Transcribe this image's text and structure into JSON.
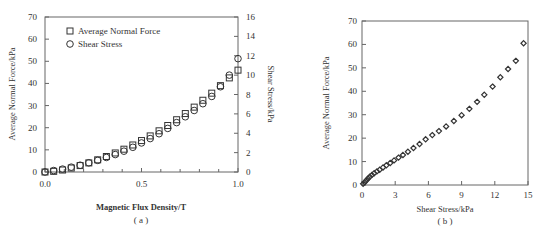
{
  "chart_data": [
    {
      "id": "a",
      "type": "scatter",
      "panel_label": "( a )",
      "title": "",
      "xlabel": "Magnetic Flux Density/T",
      "ylabel": "Average Normal Force/kPa",
      "y2label": "Shear Stress/kPa",
      "xlim": [
        0,
        1.0
      ],
      "ylim": [
        0,
        70
      ],
      "y2lim": [
        0,
        16
      ],
      "xticks": [
        "0.0",
        "0.5",
        "1.0"
      ],
      "yticks": [
        "0",
        "10",
        "20",
        "30",
        "40",
        "50",
        "60",
        "70"
      ],
      "y2ticks": [
        "0",
        "2",
        "4",
        "6",
        "8",
        "10",
        "12",
        "14",
        "16"
      ],
      "grid": false,
      "legend_position": "upper-left",
      "x": [
        0.0,
        0.045,
        0.091,
        0.136,
        0.182,
        0.227,
        0.273,
        0.318,
        0.364,
        0.409,
        0.455,
        0.5,
        0.545,
        0.591,
        0.636,
        0.682,
        0.727,
        0.773,
        0.818,
        0.864,
        0.909,
        0.955,
        1.0
      ],
      "series": [
        {
          "name": "Average Normal Force",
          "marker": "square",
          "axis": "left",
          "values": [
            0,
            0.3,
            0.9,
            1.8,
            2.9,
            4.1,
            5.5,
            7.0,
            8.6,
            10.3,
            12.2,
            14.2,
            16.3,
            18.6,
            21.0,
            23.6,
            26.4,
            29.3,
            32.4,
            35.6,
            39.0,
            42.5,
            46.0
          ]
        },
        {
          "name": "Shear Stress",
          "marker": "circle",
          "axis": "right",
          "values": [
            0,
            0.15,
            0.3,
            0.5,
            0.7,
            0.95,
            1.2,
            1.5,
            1.8,
            2.15,
            2.55,
            3.0,
            3.45,
            3.95,
            4.5,
            5.1,
            5.7,
            6.35,
            7.05,
            7.8,
            8.8,
            10.0,
            11.7
          ]
        }
      ]
    },
    {
      "id": "b",
      "type": "scatter",
      "panel_label": "( b )",
      "title": "",
      "xlabel": "Shear Stress/kPa",
      "ylabel": "Average Normal Force/kPa",
      "xlim": [
        0,
        15
      ],
      "ylim": [
        0,
        70
      ],
      "xticks": [
        "0",
        "3",
        "6",
        "9",
        "12",
        "15"
      ],
      "yticks": [
        "0",
        "10",
        "20",
        "30",
        "40",
        "50",
        "60",
        "70"
      ],
      "grid": false,
      "series": [
        {
          "name": "Average Normal Force vs Shear Stress",
          "marker": "diamond",
          "x": [
            0.1,
            0.25,
            0.4,
            0.55,
            0.7,
            0.9,
            1.1,
            1.35,
            1.6,
            1.9,
            2.2,
            2.55,
            2.9,
            3.3,
            3.7,
            4.15,
            4.65,
            5.2,
            5.75,
            6.35,
            6.95,
            7.6,
            8.3,
            9.0,
            9.7,
            10.4,
            11.05,
            11.8,
            12.5,
            13.2,
            13.9,
            14.6
          ],
          "y": [
            0.5,
            1.2,
            2.0,
            2.8,
            3.5,
            4.3,
            5.0,
            5.8,
            6.5,
            7.5,
            8.4,
            9.4,
            10.5,
            11.7,
            12.8,
            14.2,
            15.8,
            17.5,
            19.5,
            21.3,
            23.0,
            25.0,
            27.3,
            29.8,
            32.5,
            35.5,
            38.5,
            42.0,
            46.0,
            49.5,
            53.0,
            60.5
          ]
        }
      ]
    }
  ]
}
